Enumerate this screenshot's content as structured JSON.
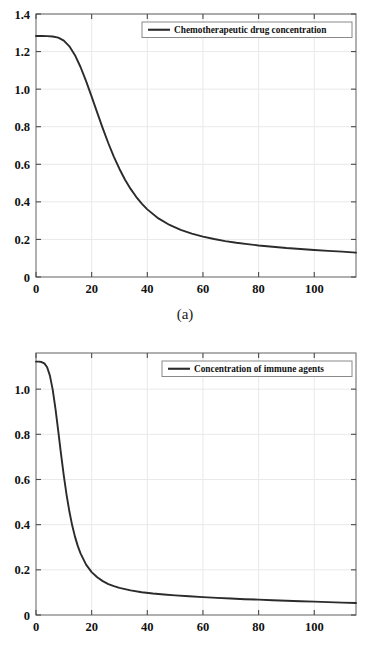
{
  "figure": {
    "panels": [
      {
        "caption": "(a)",
        "legend": "Chemotherapeutic drug concentration",
        "xlabel": "Time (d)",
        "xticks": [
          "0",
          "20",
          "40",
          "60",
          "80",
          "100"
        ],
        "yticks": [
          "0",
          "0.2",
          "0.4",
          "0.6",
          "0.8",
          "1.0",
          "1.2",
          "1.4"
        ]
      },
      {
        "caption": "(b)",
        "legend": "Concentration of immune agents",
        "xlabel": "Time (d)",
        "xticks": [
          "0",
          "20",
          "40",
          "60",
          "80",
          "100"
        ],
        "yticks": [
          "0",
          "0.2",
          "0.4",
          "0.6",
          "0.8",
          "1.0"
        ]
      }
    ]
  },
  "chart_data": [
    {
      "type": "line",
      "title": "",
      "xlabel": "Time (d)",
      "ylabel": "",
      "xlim": [
        0,
        115
      ],
      "ylim": [
        0,
        1.4
      ],
      "xticks": [
        0,
        20,
        40,
        60,
        80,
        100
      ],
      "yticks": [
        0,
        0.2,
        0.4,
        0.6,
        0.8,
        1.0,
        1.2,
        1.4
      ],
      "grid": true,
      "legend_position": "top-right",
      "caption": "(a)",
      "series": [
        {
          "name": "Chemotherapeutic drug concentration",
          "color": "#2b2b2b",
          "x": [
            0,
            2,
            4,
            6,
            8,
            10,
            12,
            14,
            16,
            18,
            20,
            22,
            24,
            26,
            28,
            30,
            32,
            34,
            36,
            38,
            40,
            44,
            48,
            52,
            56,
            60,
            64,
            68,
            72,
            76,
            80,
            85,
            90,
            95,
            100,
            105,
            110,
            115
          ],
          "y": [
            1.283,
            1.283,
            1.282,
            1.28,
            1.274,
            1.258,
            1.228,
            1.181,
            1.118,
            1.043,
            0.96,
            0.875,
            0.791,
            0.712,
            0.64,
            0.575,
            0.518,
            0.469,
            0.427,
            0.391,
            0.36,
            0.312,
            0.277,
            0.251,
            0.231,
            0.215,
            0.202,
            0.191,
            0.182,
            0.175,
            0.168,
            0.161,
            0.154,
            0.149,
            0.144,
            0.139,
            0.135,
            0.13
          ]
        }
      ]
    },
    {
      "type": "line",
      "title": "",
      "xlabel": "Time (d)",
      "ylabel": "",
      "xlim": [
        0,
        115
      ],
      "ylim": [
        0,
        1.16
      ],
      "xticks": [
        0,
        20,
        40,
        60,
        80,
        100
      ],
      "yticks": [
        0,
        0.2,
        0.4,
        0.6,
        0.8,
        1.0
      ],
      "grid": true,
      "legend_position": "top-right",
      "caption": "(b)",
      "series": [
        {
          "name": "Concentration of immune agents",
          "color": "#2b2b2b",
          "x": [
            0,
            1,
            2,
            3,
            4,
            5,
            6,
            7,
            8,
            9,
            10,
            11,
            12,
            13,
            14,
            15,
            16,
            18,
            20,
            22,
            24,
            26,
            28,
            30,
            34,
            38,
            42,
            46,
            50,
            55,
            60,
            65,
            70,
            75,
            80,
            85,
            90,
            95,
            100,
            105,
            110,
            115
          ],
          "y": [
            1.122,
            1.122,
            1.12,
            1.114,
            1.097,
            1.06,
            0.998,
            0.913,
            0.814,
            0.712,
            0.616,
            0.531,
            0.458,
            0.397,
            0.347,
            0.306,
            0.273,
            0.223,
            0.19,
            0.167,
            0.15,
            0.137,
            0.128,
            0.12,
            0.109,
            0.101,
            0.095,
            0.091,
            0.087,
            0.083,
            0.079,
            0.076,
            0.073,
            0.07,
            0.068,
            0.065,
            0.063,
            0.061,
            0.059,
            0.057,
            0.055,
            0.053
          ]
        }
      ]
    }
  ]
}
